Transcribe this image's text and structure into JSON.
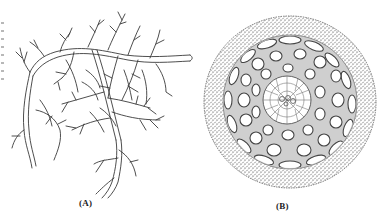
{
  "figure": {
    "panels": [
      {
        "id": "A",
        "label": "(A)",
        "subject": "branching root system line drawing"
      },
      {
        "id": "B",
        "label": "(B)",
        "subject": "root transverse section with cortex cells and central stele"
      }
    ],
    "colors": {
      "ink": "#3a3a3a",
      "paper": "#ffffff",
      "stipple": "#8a8a8a"
    }
  }
}
